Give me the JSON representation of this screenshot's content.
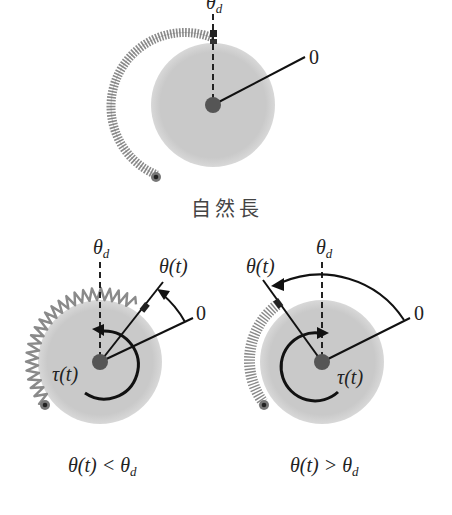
{
  "diagram": {
    "top": {
      "theta_d_label": "θ",
      "theta_d_sub": "d",
      "zero_label": "0",
      "caption": "自然長"
    },
    "left": {
      "theta_d_label": "θ",
      "theta_d_sub": "d",
      "theta_t_label": "θ(t)",
      "zero_label": "0",
      "tau_label": "τ(t)",
      "caption_main": "θ(t) < θ",
      "caption_sub": "d"
    },
    "right": {
      "theta_d_label": "θ",
      "theta_d_sub": "d",
      "theta_t_label": "θ(t)",
      "zero_label": "0",
      "tau_label": "τ(t)",
      "caption_main": "θ(t) > θ",
      "caption_sub": "d"
    },
    "colors": {
      "disk": "#c8c8c8",
      "hub": "#555555",
      "spring": "#8a8a8a",
      "line": "#111111"
    }
  }
}
